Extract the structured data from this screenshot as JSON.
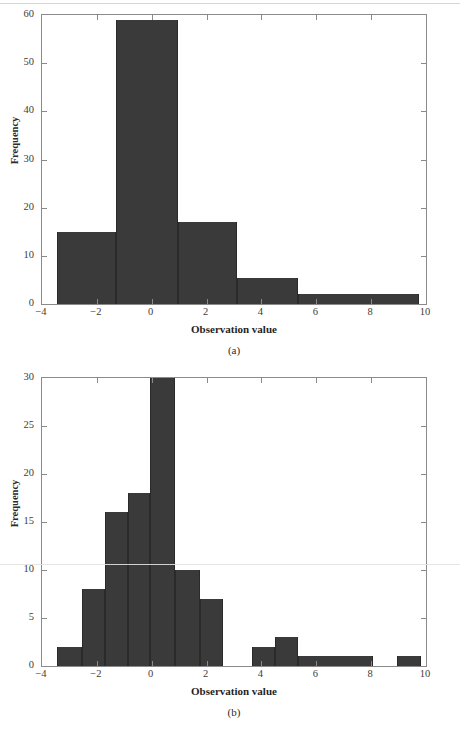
{
  "figure_a": {
    "caption": "(a)",
    "chart_data": {
      "type": "bar",
      "title": "",
      "xlabel": "Observation value",
      "ylabel": "Frequency",
      "xlim": [
        -4,
        10
      ],
      "ylim": [
        0,
        60
      ],
      "xticks": [
        "-4",
        "-2",
        "0",
        "2",
        "4",
        "6",
        "8",
        "10"
      ],
      "xtick_values": [
        -4,
        -2,
        0,
        2,
        4,
        6,
        8,
        10
      ],
      "yticks": [
        "0",
        "10",
        "20",
        "30",
        "40",
        "50",
        "60"
      ],
      "ytick_values": [
        0,
        10,
        20,
        30,
        40,
        50,
        60
      ],
      "grid": false,
      "legend": "none",
      "bar_color": "#3a3a3a",
      "bins": [
        {
          "start": -3.45,
          "end": -1.3,
          "value": 15
        },
        {
          "start": -1.3,
          "end": 0.95,
          "value": 59
        },
        {
          "start": 0.95,
          "end": 3.1,
          "value": 17
        },
        {
          "start": 3.1,
          "end": 5.35,
          "value": 5.4
        },
        {
          "start": 5.35,
          "end": 9.75,
          "value": 2
        }
      ]
    }
  },
  "figure_b": {
    "caption": "(b)",
    "chart_data": {
      "type": "bar",
      "title": "",
      "xlabel": "Observation value",
      "ylabel": "Frequency",
      "xlim": [
        -4,
        10
      ],
      "ylim": [
        0,
        30
      ],
      "xticks": [
        "-4",
        "-2",
        "0",
        "2",
        "4",
        "6",
        "8",
        "10"
      ],
      "xtick_values": [
        -4,
        -2,
        0,
        2,
        4,
        6,
        8,
        10
      ],
      "yticks": [
        "0",
        "5",
        "10",
        "15",
        "20",
        "25",
        "30"
      ],
      "ytick_values": [
        0,
        5,
        10,
        15,
        20,
        25,
        30
      ],
      "grid": false,
      "legend": "none",
      "bar_color": "#3a3a3a",
      "bins": [
        {
          "start": -3.45,
          "end": -2.55,
          "value": 2
        },
        {
          "start": -2.55,
          "end": -1.7,
          "value": 8
        },
        {
          "start": -1.7,
          "end": -0.85,
          "value": 16
        },
        {
          "start": -0.85,
          "end": -0.05,
          "value": 18
        },
        {
          "start": -0.05,
          "end": 0.85,
          "value": 33
        },
        {
          "start": 0.85,
          "end": 1.75,
          "value": 10
        },
        {
          "start": 1.75,
          "end": 2.6,
          "value": 7
        },
        {
          "start": 3.65,
          "end": 4.5,
          "value": 2
        },
        {
          "start": 4.5,
          "end": 5.35,
          "value": 3
        },
        {
          "start": 5.35,
          "end": 8.05,
          "value": 1
        },
        {
          "start": 8.95,
          "end": 9.8,
          "value": 1
        }
      ]
    }
  }
}
